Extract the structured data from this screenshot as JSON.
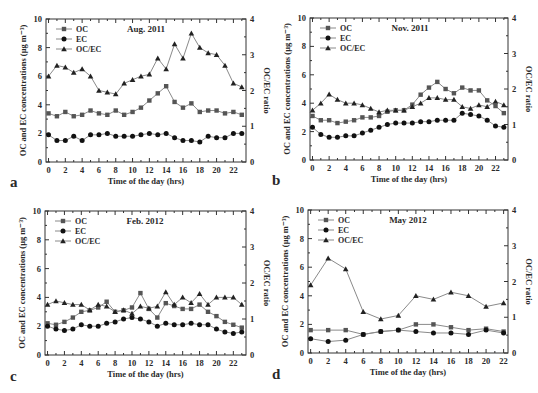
{
  "chart_data": [
    {
      "type": "line",
      "panel_letter": "a",
      "title": "Aug. 2011",
      "xlabel": "Time of the day (hrs)",
      "ylabel": "OC and EC concentrations (μg m⁻³)",
      "ylabel_right": "OC/EC ratio",
      "xlim": [
        -0.3,
        23.5
      ],
      "ylim": [
        0,
        10
      ],
      "ylim_right": [
        0,
        4
      ],
      "xticks": [
        0,
        2,
        4,
        6,
        8,
        10,
        12,
        14,
        16,
        18,
        20,
        22
      ],
      "yticks": [
        0,
        2,
        4,
        6,
        8,
        10
      ],
      "yticks_right": [
        0,
        1,
        2,
        3,
        4
      ],
      "legend": "top-left",
      "grid": false,
      "x": [
        0,
        1,
        2,
        3,
        4,
        5,
        6,
        7,
        8,
        9,
        10,
        11,
        12,
        13,
        14,
        15,
        16,
        17,
        18,
        19,
        20,
        21,
        22,
        23
      ],
      "series": [
        {
          "name": "OC",
          "marker": "square",
          "axis": "left",
          "values": [
            3.4,
            3.2,
            3.5,
            3.2,
            3.3,
            3.6,
            3.4,
            3.3,
            3.6,
            3.3,
            3.5,
            3.8,
            4.3,
            4.8,
            5.3,
            4.2,
            3.8,
            4.1,
            3.5,
            3.6,
            3.6,
            3.4,
            3.5,
            3.3
          ]
        },
        {
          "name": "EC",
          "marker": "circle",
          "axis": "left",
          "values": [
            1.9,
            1.5,
            1.5,
            1.8,
            1.5,
            1.9,
            1.9,
            2.0,
            1.8,
            1.8,
            1.8,
            1.9,
            2.0,
            1.9,
            2.0,
            1.7,
            1.5,
            1.5,
            1.4,
            1.8,
            1.7,
            1.7,
            2.0,
            2.0
          ]
        },
        {
          "name": "OC/EC",
          "marker": "triangle",
          "axis": "right",
          "values": [
            2.4,
            2.7,
            2.65,
            2.5,
            2.6,
            2.4,
            2.0,
            1.95,
            1.9,
            2.2,
            2.3,
            2.4,
            2.45,
            2.9,
            2.6,
            3.3,
            2.9,
            3.6,
            3.2,
            3.05,
            3.0,
            2.7,
            2.2,
            2.1
          ]
        }
      ]
    },
    {
      "type": "line",
      "panel_letter": "b",
      "title": "Nov. 2011",
      "xlabel": "Time of the day (hrs)",
      "ylabel": "OC and EC concentrations (μg m⁻³)",
      "ylabel_right": "OC/EC ratio",
      "xlim": [
        -0.3,
        23.5
      ],
      "ylim": [
        0,
        10
      ],
      "ylim_right": [
        0,
        4
      ],
      "xticks": [
        0,
        2,
        4,
        6,
        8,
        10,
        12,
        14,
        16,
        18,
        20,
        22
      ],
      "yticks": [
        0,
        2,
        4,
        6,
        8,
        10
      ],
      "yticks_right": [
        0,
        1,
        2,
        3,
        4
      ],
      "legend": "top-left",
      "grid": false,
      "x": [
        0,
        1,
        2,
        3,
        4,
        5,
        6,
        7,
        8,
        9,
        10,
        11,
        12,
        13,
        14,
        15,
        16,
        17,
        18,
        19,
        20,
        21,
        22,
        23
      ],
      "series": [
        {
          "name": "OC",
          "marker": "square",
          "axis": "left",
          "values": [
            3.1,
            2.8,
            2.8,
            2.6,
            2.7,
            2.8,
            3.0,
            3.0,
            3.1,
            3.4,
            3.5,
            3.5,
            3.9,
            4.6,
            5.1,
            5.5,
            5.0,
            4.7,
            5.1,
            4.9,
            4.9,
            4.2,
            3.8,
            3.3
          ]
        },
        {
          "name": "EC",
          "marker": "circle",
          "axis": "left",
          "values": [
            2.3,
            1.8,
            1.6,
            1.6,
            1.7,
            1.7,
            1.9,
            2.1,
            2.3,
            2.5,
            2.6,
            2.6,
            2.6,
            2.7,
            2.7,
            2.8,
            2.8,
            2.8,
            3.3,
            3.2,
            3.1,
            2.8,
            2.4,
            2.3
          ]
        },
        {
          "name": "OC/EC",
          "marker": "triangle",
          "axis": "right",
          "values": [
            1.4,
            1.6,
            1.85,
            1.7,
            1.6,
            1.6,
            1.55,
            1.45,
            1.35,
            1.4,
            1.4,
            1.4,
            1.5,
            1.6,
            1.75,
            1.75,
            1.7,
            1.7,
            1.5,
            1.45,
            1.55,
            1.5,
            1.65,
            1.55
          ]
        }
      ]
    },
    {
      "type": "line",
      "panel_letter": "c",
      "title": "Feb. 2012",
      "xlabel": "Time of the day (hrs)",
      "ylabel": "OC and EC concentrations (μg m⁻³)",
      "ylabel_right": "OC/EC ratio",
      "xlim": [
        -0.3,
        23.5
      ],
      "ylim": [
        0,
        10
      ],
      "ylim_right": [
        0,
        4
      ],
      "xticks": [
        0,
        2,
        4,
        6,
        8,
        10,
        12,
        14,
        16,
        18,
        20,
        22
      ],
      "yticks": [
        0,
        2,
        4,
        6,
        8,
        10
      ],
      "yticks_right": [
        0,
        1,
        2,
        3,
        4
      ],
      "legend": "top-left",
      "grid": false,
      "x": [
        0,
        1,
        2,
        3,
        4,
        5,
        6,
        7,
        8,
        9,
        10,
        11,
        12,
        13,
        14,
        15,
        16,
        17,
        18,
        19,
        20,
        21,
        22,
        23
      ],
      "series": [
        {
          "name": "OC",
          "marker": "square",
          "axis": "left",
          "values": [
            2.2,
            2.1,
            2.3,
            2.6,
            3.0,
            3.1,
            3.3,
            3.7,
            3.0,
            3.1,
            3.3,
            4.3,
            3.2,
            2.6,
            3.6,
            3.4,
            3.2,
            3.2,
            3.5,
            3.0,
            2.7,
            2.3,
            2.1,
            1.9
          ]
        },
        {
          "name": "EC",
          "marker": "circle",
          "axis": "left",
          "values": [
            2.0,
            1.8,
            1.7,
            1.8,
            2.1,
            2.0,
            2.0,
            2.2,
            2.3,
            2.5,
            2.6,
            2.5,
            2.3,
            2.0,
            2.2,
            2.1,
            2.1,
            2.2,
            2.1,
            2.1,
            1.8,
            1.6,
            1.5,
            1.6
          ]
        },
        {
          "name": "OC/EC",
          "marker": "triangle",
          "axis": "right",
          "values": [
            1.4,
            1.5,
            1.45,
            1.4,
            1.4,
            1.25,
            1.4,
            1.35,
            1.2,
            1.25,
            1.15,
            1.35,
            1.3,
            1.35,
            1.75,
            1.4,
            1.6,
            1.45,
            1.7,
            1.4,
            1.6,
            1.6,
            1.6,
            1.4
          ]
        }
      ]
    },
    {
      "type": "line",
      "panel_letter": "d",
      "title": "May 2012",
      "xlabel": "Time of the day (hrs)",
      "ylabel": "OC and EC concentrations (μg m⁻³)",
      "ylabel_right": "OC/EC ratio",
      "xlim": [
        -0.3,
        22.5
      ],
      "ylim": [
        0,
        10
      ],
      "ylim_right": [
        0,
        4
      ],
      "xticks": [
        0,
        2,
        4,
        6,
        8,
        10,
        12,
        14,
        16,
        18,
        20,
        22
      ],
      "yticks": [
        0,
        2,
        4,
        6,
        8,
        10
      ],
      "yticks_right": [
        0,
        1,
        2,
        3,
        4
      ],
      "legend": "top-left",
      "grid": false,
      "x": [
        0,
        2,
        4,
        6,
        8,
        10,
        12,
        14,
        16,
        18,
        20,
        22
      ],
      "series": [
        {
          "name": "OC",
          "marker": "square",
          "axis": "left",
          "values": [
            1.6,
            1.6,
            1.6,
            1.3,
            1.5,
            1.6,
            2.0,
            2.0,
            1.8,
            1.6,
            1.7,
            1.5
          ]
        },
        {
          "name": "EC",
          "marker": "circle",
          "axis": "left",
          "values": [
            1.0,
            0.8,
            0.9,
            1.3,
            1.5,
            1.6,
            1.5,
            1.4,
            1.4,
            1.3,
            1.6,
            1.4
          ]
        },
        {
          "name": "OC/EC",
          "marker": "triangle",
          "axis": "right",
          "values": [
            1.9,
            2.65,
            2.35,
            1.15,
            0.95,
            1.05,
            1.6,
            1.5,
            1.7,
            1.6,
            1.3,
            1.4
          ]
        }
      ]
    }
  ]
}
